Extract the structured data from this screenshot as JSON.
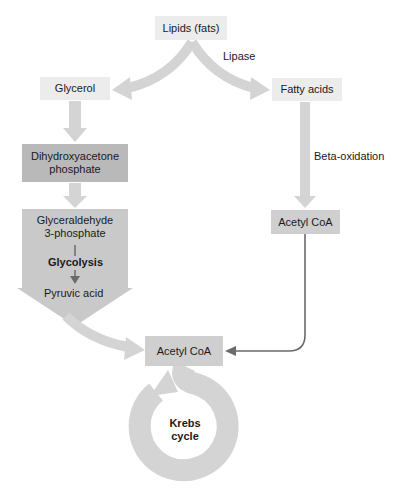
{
  "diagram": {
    "nodes": {
      "lipids": "Lipids (fats)",
      "glycerol": "Glycerol",
      "fatty_acids": "Fatty acids",
      "dhap_line1": "Dihydroxyacetone",
      "dhap_line2": "phosphate",
      "g3p_line1": "Glyceraldehyde",
      "g3p_line2": "3-phosphate",
      "pyruvic_acid": "Pyruvic acid",
      "acetyl_coa_right": "Acetyl CoA",
      "acetyl_coa_center": "Acetyl CoA",
      "krebs_line1": "Krebs",
      "krebs_line2": "cycle"
    },
    "labels": {
      "lipase": "Lipase",
      "beta_oxidation": "Beta-oxidation",
      "glycolysis": "Glycolysis"
    },
    "colors": {
      "arrow_light": "#d4d4d4",
      "box_light": "#ececec",
      "box_mid": "#cfcfcf",
      "box_dark": "#b9b9b9",
      "connector": "#6b6b6b"
    }
  }
}
